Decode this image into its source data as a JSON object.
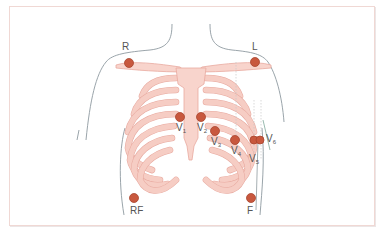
{
  "diagram": {
    "colors": {
      "frame_border": "#f0d8d4",
      "bone_fill": "#f8d4cc",
      "bone_edge": "#e8aaa0",
      "electrode": "#c8583e",
      "body_outline": "#8f9aa0",
      "label_text": "#555555",
      "axis_line_green": "#7fa89a"
    },
    "limb_electrodes": [
      {
        "id": "R",
        "label": "R",
        "position": "right shoulder"
      },
      {
        "id": "L",
        "label": "L",
        "position": "left shoulder"
      },
      {
        "id": "RF",
        "label": "RF",
        "position": "right lower torso"
      },
      {
        "id": "F",
        "label": "F",
        "position": "left lower torso"
      }
    ],
    "chest_electrodes": [
      {
        "id": "V1",
        "label": "V",
        "sub": "1"
      },
      {
        "id": "V2",
        "label": "V",
        "sub": "2"
      },
      {
        "id": "V3",
        "label": "V",
        "sub": "3"
      },
      {
        "id": "V4",
        "label": "V",
        "sub": "4"
      },
      {
        "id": "V5",
        "label": "V",
        "sub": "5"
      },
      {
        "id": "V6",
        "label": "V",
        "sub": "6"
      }
    ]
  }
}
